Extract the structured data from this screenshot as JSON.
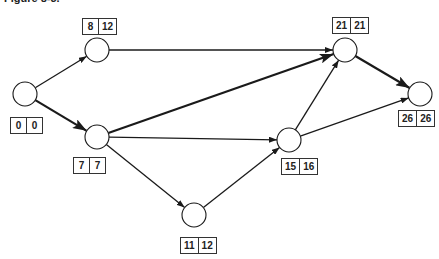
{
  "caption": "Figure 8-3.",
  "nodes": [
    {
      "id": "A",
      "x": 25,
      "y": 94,
      "early": "0",
      "late": "0",
      "box_x": 10,
      "box_y": 117
    },
    {
      "id": "B",
      "x": 97,
      "y": 50,
      "early": "8",
      "late": "12",
      "box_x": 82,
      "box_y": 18
    },
    {
      "id": "C",
      "x": 97,
      "y": 137,
      "early": "7",
      "late": "7",
      "box_x": 73,
      "box_y": 157
    },
    {
      "id": "D",
      "x": 194,
      "y": 215,
      "early": "11",
      "late": "12",
      "box_x": 180,
      "box_y": 237
    },
    {
      "id": "E",
      "x": 289,
      "y": 140,
      "early": "15",
      "late": "16",
      "box_x": 281,
      "box_y": 158
    },
    {
      "id": "F",
      "x": 345,
      "y": 50,
      "early": "21",
      "late": "21",
      "box_x": 332,
      "box_y": 17
    },
    {
      "id": "G",
      "x": 420,
      "y": 94,
      "early": "26",
      "late": "26",
      "box_x": 398,
      "box_y": 110
    }
  ],
  "edges": [
    {
      "from": "A",
      "to": "B",
      "critical": false
    },
    {
      "from": "A",
      "to": "C",
      "critical": true
    },
    {
      "from": "B",
      "to": "F",
      "critical": false
    },
    {
      "from": "C",
      "to": "F",
      "critical": true
    },
    {
      "from": "C",
      "to": "E",
      "critical": false
    },
    {
      "from": "C",
      "to": "D",
      "critical": false
    },
    {
      "from": "D",
      "to": "E",
      "critical": false
    },
    {
      "from": "E",
      "to": "F",
      "critical": false
    },
    {
      "from": "E",
      "to": "G",
      "critical": false
    },
    {
      "from": "F",
      "to": "G",
      "critical": true
    }
  ],
  "colors": {
    "line": "#1a1a1a",
    "node_fill": "#ffffff"
  }
}
